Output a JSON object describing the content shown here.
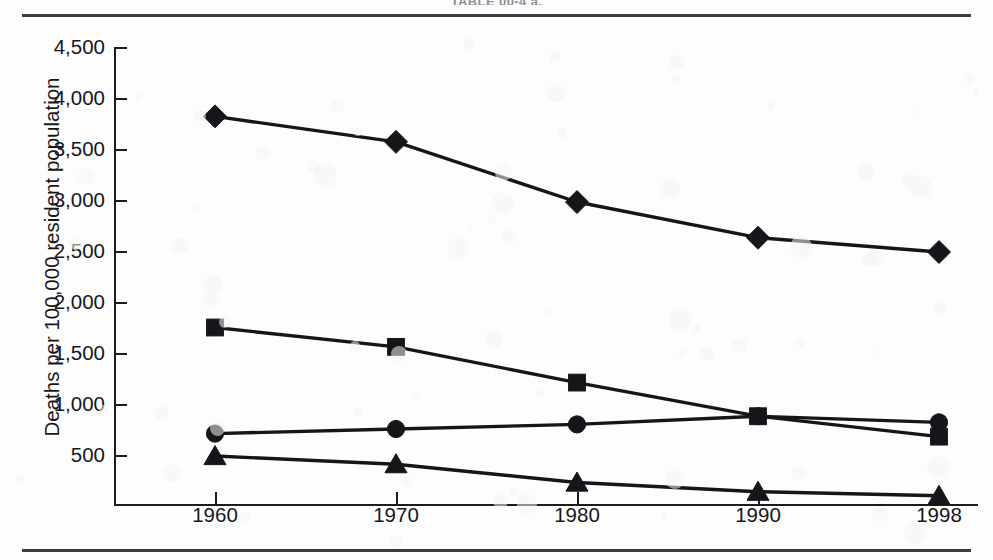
{
  "figure": {
    "caption": "TABLE 00-4 a."
  },
  "chart_data": {
    "type": "line",
    "title": "",
    "subtitle": "",
    "xlabel": "",
    "ylabel": "Deaths per 100,000 resident population",
    "categories": [
      "1960",
      "1970",
      "1980",
      "1990",
      "1998"
    ],
    "x": [
      1960,
      1970,
      1980,
      1990,
      1998
    ],
    "xtick_labels": [
      "1960",
      "1970",
      "1980",
      "1990",
      "1998"
    ],
    "ytick_labels": [
      "4,500",
      "4,000",
      "3,500",
      "3,000",
      "2,500",
      "2,000",
      "1,500",
      "1,000",
      "500"
    ],
    "ytick_values": [
      4500,
      4000,
      3500,
      3000,
      2500,
      2000,
      1500,
      1000,
      500
    ],
    "ylim": [
      0,
      4500
    ],
    "xlim": [
      1955,
      2002
    ],
    "grid": false,
    "legend": "none",
    "series": [
      {
        "name": "series-diamond",
        "marker": "diamond",
        "color": "#16161a",
        "values": [
          3820,
          3570,
          2980,
          2630,
          2490
        ]
      },
      {
        "name": "series-square",
        "marker": "square",
        "color": "#16161a",
        "values": [
          1750,
          1560,
          1210,
          880,
          680
        ]
      },
      {
        "name": "series-circle",
        "marker": "circle",
        "color": "#16161a",
        "values": [
          710,
          755,
          800,
          880,
          820
        ]
      },
      {
        "name": "series-triangle",
        "marker": "triangle",
        "color": "#16161a",
        "values": [
          490,
          410,
          230,
          140,
          100
        ]
      }
    ]
  }
}
